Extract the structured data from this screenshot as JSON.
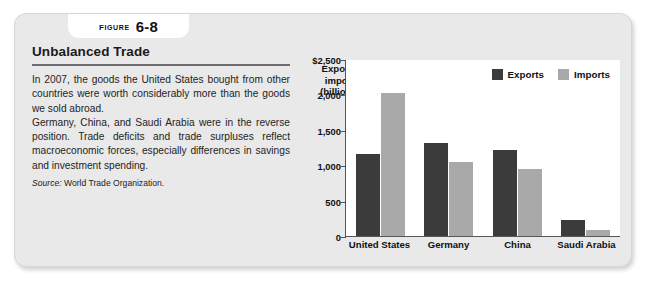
{
  "figure": {
    "label_word": "FIGURE",
    "number": "6-8",
    "title": "Unbalanced Trade"
  },
  "body": {
    "paragraph_1": "In 2007, the goods the United States bought from other countries were worth considerably more than the goods we sold abroad.",
    "paragraph_2": "Germany, China, and Saudi Arabia were in the reverse position. Trade deficits and trade surpluses reflect macroeconomic forces, especially differences in savings and investment spending.",
    "source_label": "Source:",
    "source_text": "World Trade Organization."
  },
  "chart_data": {
    "type": "bar",
    "title": "",
    "ylabel": "Exports, imports (billions)",
    "xlabel": "",
    "categories": [
      "United States",
      "Germany",
      "China",
      "Saudi Arabia"
    ],
    "series": [
      {
        "name": "Exports",
        "color": "#3b3b3b",
        "values": [
          1160,
          1320,
          1220,
          220
        ]
      },
      {
        "name": "Imports",
        "color": "#a9a9a9",
        "values": [
          2020,
          1050,
          950,
          90
        ]
      }
    ],
    "ylim": [
      0,
      2500
    ],
    "ytick_values": [
      2500,
      2000,
      1500,
      1000,
      500,
      0
    ],
    "ytick_labels": [
      "$2,500",
      "2,000",
      "1,500",
      "1,000",
      "500",
      "0"
    ],
    "grid": false,
    "legend_position": "top-right"
  },
  "colors": {
    "panel_background": "#e9e9e9",
    "plot_background": "#ffffff",
    "exports": "#3b3b3b",
    "imports": "#a9a9a9",
    "rule": "#6d6d6d"
  }
}
